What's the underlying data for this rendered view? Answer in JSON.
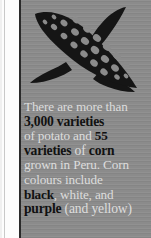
{
  "panel": {
    "background_color": "#8b8b8b",
    "accent_color": "#2a2a2a",
    "text_color_regular": "#dddddd",
    "text_color_bold": "#111111"
  },
  "illustration": {
    "name": "corn-cob-icon",
    "description": "black silhouette of an ear of corn with husk leaves and kernel cutouts",
    "color": "#151515"
  },
  "fact": {
    "full_text": "There are more than 3,000 varieties of potato and 55 varieties of corn grown in Peru. Corn colours include black, white, and purple (and yellow)",
    "lines": [
      {
        "id": "line-1",
        "parts": [
          {
            "text": "There are more than",
            "bold": false
          }
        ]
      },
      {
        "id": "line-2",
        "parts": [
          {
            "text": "3,000 varieties",
            "bold": true
          }
        ]
      },
      {
        "id": "line-3",
        "parts": [
          {
            "text": "of potato and ",
            "bold": false
          },
          {
            "text": "55",
            "bold": true
          }
        ]
      },
      {
        "id": "line-4",
        "parts": [
          {
            "text": "varieties",
            "bold": true
          },
          {
            "text": " of ",
            "bold": false
          },
          {
            "text": "corn",
            "bold": true
          }
        ]
      },
      {
        "id": "line-5",
        "parts": [
          {
            "text": "grown in Peru. Corn",
            "bold": false
          }
        ]
      },
      {
        "id": "line-6",
        "parts": [
          {
            "text": "colours include",
            "bold": false
          }
        ]
      },
      {
        "id": "line-7",
        "parts": [
          {
            "text": "black",
            "bold": true
          },
          {
            "text": ", white, and",
            "bold": false
          }
        ]
      },
      {
        "id": "line-8",
        "parts": [
          {
            "text": "purple",
            "bold": true
          },
          {
            "text": " (and yellow)",
            "bold": false
          }
        ]
      }
    ],
    "highlighted_terms": [
      "3,000 varieties",
      "55",
      "varieties",
      "corn",
      "black",
      "purple"
    ]
  }
}
